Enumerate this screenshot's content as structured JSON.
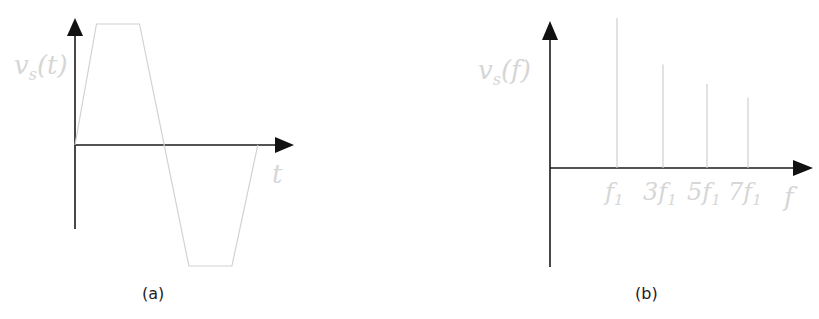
{
  "panel_a": {
    "caption": "(a)",
    "ylabel": "v_s(t)",
    "ylabel_main": "v",
    "ylabel_sub": "s",
    "ylabel_rest": "(t)",
    "xlabel": "t",
    "waveform": "trapezoidal wave, one period",
    "points_t_v": [
      [
        0,
        0
      ],
      [
        0.1,
        1
      ],
      [
        0.3,
        1
      ],
      [
        0.53,
        -1
      ],
      [
        0.73,
        -1
      ],
      [
        0.85,
        0
      ]
    ]
  },
  "panel_b": {
    "caption": "(b)",
    "ylabel_main": "v",
    "ylabel_sub": "s",
    "ylabel_rest": "(f)",
    "xlabel": "f"
  },
  "chart_data": [
    {
      "type": "line",
      "title": "(a)",
      "xlabel": "t",
      "ylabel": "v_s(t)",
      "x": [
        0,
        0.1,
        0.3,
        0.53,
        0.73,
        0.85
      ],
      "series": [
        {
          "name": "v_s(t)",
          "values": [
            0,
            1,
            1,
            -1,
            -1,
            0
          ]
        }
      ],
      "ylim": [
        -1,
        1
      ],
      "grid": false
    },
    {
      "type": "bar",
      "title": "(b)",
      "xlabel": "f",
      "ylabel": "v_s(f)",
      "categories": [
        "f1",
        "3f1",
        "5f1",
        "7f1"
      ],
      "tick_labels": [
        {
          "main": "f",
          "pre": "",
          "sub": "1"
        },
        {
          "main": "f",
          "pre": "3",
          "sub": "1"
        },
        {
          "main": "f",
          "pre": "5",
          "sub": "1"
        },
        {
          "main": "f",
          "pre": "7",
          "sub": "1"
        }
      ],
      "values": [
        1.0,
        0.69,
        0.56,
        0.47
      ],
      "ylim": [
        0,
        1
      ],
      "grid": false
    }
  ]
}
